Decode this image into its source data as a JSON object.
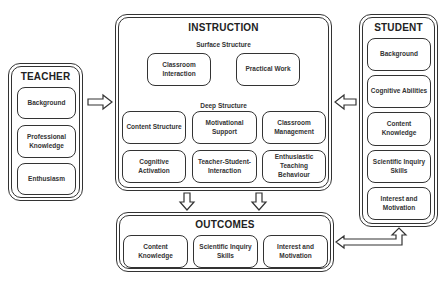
{
  "teacher": {
    "title": "TEACHER",
    "items": [
      {
        "label": "Background"
      },
      {
        "label": "Professional Knowledge"
      },
      {
        "label": "Enthusiasm"
      }
    ]
  },
  "instruction": {
    "title": "INSTRUCTION",
    "surface_label": "Surface Structure",
    "surface_items": [
      {
        "label": "Classroom Interaction"
      },
      {
        "label": "Practical Work"
      }
    ],
    "deep_label": "Deep Structure",
    "deep_items": [
      {
        "label": "Content Structure"
      },
      {
        "label": "Motivational Support"
      },
      {
        "label": "Classroom Management"
      },
      {
        "label": "Cognitive Activation"
      },
      {
        "label": "Teacher-Student-Interaction"
      },
      {
        "label": "Enthusiastic Teaching Behaviour"
      }
    ]
  },
  "student": {
    "title": "STUDENT",
    "items": [
      {
        "label": "Background"
      },
      {
        "label": "Cognitive Abilities"
      },
      {
        "label": "Content Knowledge"
      },
      {
        "label": "Scientific Inquiry Skills"
      },
      {
        "label": "Interest and Motivation"
      }
    ]
  },
  "outcomes": {
    "title": "OUTCOMES",
    "items": [
      {
        "label": "Content Knowledge"
      },
      {
        "label": "Scientific Inquiry Skills"
      },
      {
        "label": "Interest and Motivation"
      }
    ]
  },
  "arrows": [
    {
      "from": "teacher",
      "to": "instruction"
    },
    {
      "from": "student",
      "to": "instruction"
    },
    {
      "from": "instruction",
      "to": "outcomes"
    },
    {
      "from": "instruction",
      "to": "outcomes"
    },
    {
      "from": "outcomes",
      "to": "student",
      "bidirectional": true
    }
  ]
}
